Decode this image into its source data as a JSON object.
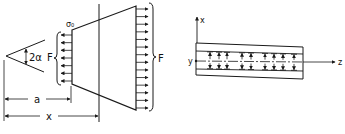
{
  "figure_left": {
    "title": "Conical converging section with end forces",
    "labels": {
      "half_angle": "2α",
      "force_left": "F",
      "stress": "σ₀",
      "force_right": "F",
      "dim_a": "a",
      "dim_x": "x"
    },
    "left_arrow_count": 7,
    "right_arrow_count": 14
  },
  "figure_right": {
    "title": "Strip with axial coordinates",
    "labels": {
      "axis_x": "x",
      "axis_y": "y",
      "axis_z": "z"
    },
    "arrow_groups_top": 4,
    "arrow_groups_bottom": 4
  },
  "colors": {
    "ink": "#1a1a1a",
    "background": "#ffffff"
  }
}
